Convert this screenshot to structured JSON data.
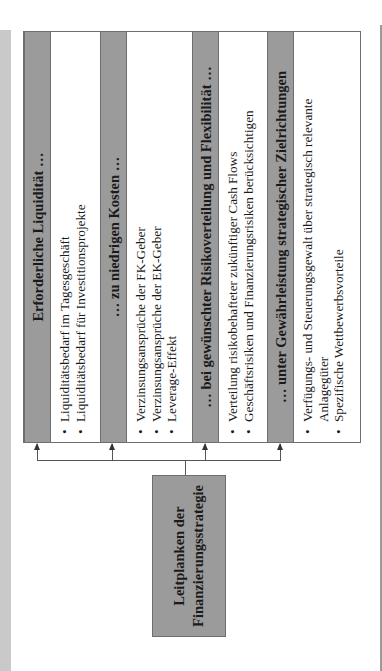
{
  "diagram": {
    "orientation": "rotated-90-ccw",
    "source": {
      "line1": "Leitplanken der",
      "line2": "Finanzierungsstrategie"
    },
    "sections": [
      {
        "title": "Erforderliche Liquidität …",
        "items": [
          "Liquiditätsbedarf im Tagesgeschäft",
          "Liquiditätsbedarf für Investitionsprojekte"
        ]
      },
      {
        "title": "… zu niedrigen Kosten …",
        "items": [
          "Verzinsungsansprüche der FK-Geber",
          "Verzinsungsansprüche der EK-Geber",
          "Leverage-Effekt"
        ]
      },
      {
        "title": "… bei gewünschter Risikoverteilung und Flexibilität …",
        "items": [
          "Verteilung risikobehafteter zukünftiger Cash Flows",
          "Geschäftsrisiken und Finanzierungsrisiken berücksichtigen"
        ]
      },
      {
        "title": "… unter Gewährleistung strategischer Zielrichtungen",
        "items": [
          "Verfügungs- und Steuerungsgewalt über strategisch relevante Anlagegüter",
          "Spezifische Wettbewerbsvorteile"
        ]
      }
    ],
    "colors": {
      "header_fill": "#9b9b9b",
      "border": "#6e6e6e",
      "page_band": "#c9c9c9",
      "connector": "#555555"
    }
  }
}
